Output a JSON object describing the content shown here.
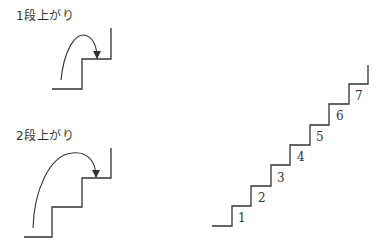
{
  "diagram": {
    "one_step": {
      "label": "1段上がり"
    },
    "two_step": {
      "label": "2段上がり"
    },
    "staircase": {
      "step_numbers": [
        "1",
        "2",
        "3",
        "4",
        "5",
        "6",
        "7"
      ]
    }
  },
  "colors": {
    "line": "#333333",
    "background": "#ffffff"
  }
}
